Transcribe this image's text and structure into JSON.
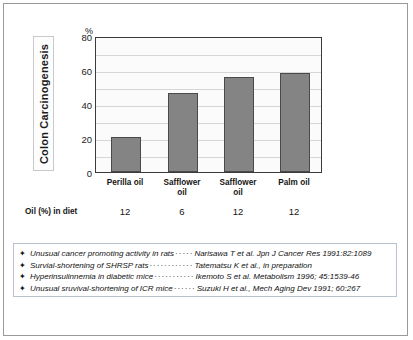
{
  "figure": {
    "y_axis_title": "Colon Carcinogenesis",
    "unit_symbol": "%",
    "diet_row_label": "Oil (%) in diet"
  },
  "chart_data": {
    "type": "bar",
    "title": "",
    "xlabel": "",
    "ylabel": "Colon Carcinogenesis",
    "unit": "%",
    "categories": [
      "Perilla oil",
      "Safflower oil",
      "Safflower oil",
      "Palm oil"
    ],
    "category_lines": [
      [
        "Perilla oil"
      ],
      [
        "Safflower",
        "oil"
      ],
      [
        "Safflower",
        "oil"
      ],
      [
        "Palm oil"
      ]
    ],
    "values": [
      21,
      47,
      57,
      59
    ],
    "diet_percent": [
      "12",
      "6",
      "12",
      "12"
    ],
    "ylim": [
      0,
      80
    ],
    "yticks": [
      0,
      20,
      40,
      60,
      80
    ],
    "ytick_labels": [
      "0",
      "20",
      "40",
      "60",
      "80"
    ],
    "gridlines": [
      10,
      20,
      30,
      40,
      50,
      60,
      70
    ],
    "grid": true,
    "legend": "none",
    "bar_color": "#848484",
    "bar_border_color": "#4a4a4a"
  },
  "notes": {
    "bullet_icon": "star",
    "items": [
      {
        "text": "Unusual cancer promoting activity in rats",
        "dots": "·····",
        "reference": "Narisawa T et al. Jpn J Cancer Res 1991:82:1089"
      },
      {
        "text": "Survial-shortening of SHRSP rats",
        "dots": "············",
        "reference": "Tatematsu K et al., in preparation"
      },
      {
        "text": "Hyperinsulinnemia in diabetic mice",
        "dots": "···········",
        "reference": "Ikemoto S et al. Metabolism 1996; 45:1539-46"
      },
      {
        "text": "Unusual sruvival-shortening of ICR mice",
        "dots": "······",
        "reference": "Suzuki H et al.,    Mech Aging Dev 1991; 60:267"
      }
    ]
  }
}
